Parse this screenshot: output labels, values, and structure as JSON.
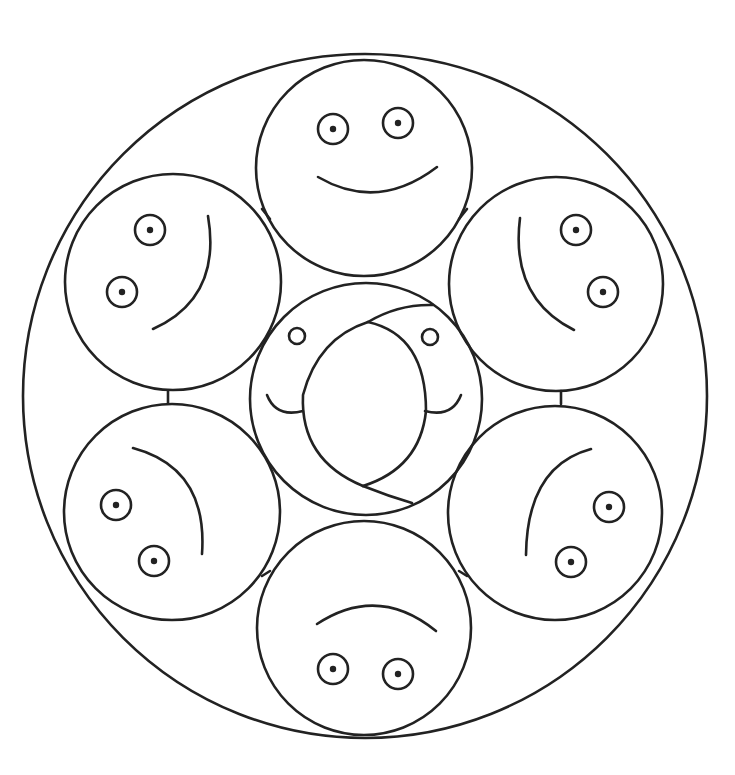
{
  "canvas": {
    "width": 735,
    "height": 775,
    "background": "#ffffff",
    "stroke": "#222222"
  },
  "mandala": {
    "outer_circle": {
      "cx": 365,
      "cy": 396,
      "r": 342
    },
    "center_face": {
      "circle": {
        "cx": 366,
        "cy": 399,
        "r": 116
      },
      "eyes": [
        {
          "cx": 297,
          "cy": 336,
          "r": 8
        },
        {
          "cx": 430,
          "cy": 337,
          "r": 8
        }
      ],
      "smiles": [
        "M 267 395 Q 276 418 303 411",
        "M 461 395 Q 452 418 425 411"
      ],
      "swirl": [
        "M 368 322 Q 318 338 303 395 Q 300 460 363 486",
        "M 368 322 Q 426 335 426 411 Q 420 468 363 486",
        "M 368 322 Q 398 304 433 305",
        "M 363 486 Q 388 496 412 503"
      ]
    },
    "faces": [
      {
        "name": "top",
        "circle": {
          "cx": 364,
          "cy": 168,
          "r": 108
        },
        "eyes": [
          {
            "cx": 333,
            "cy": 129
          },
          {
            "cx": 398,
            "cy": 123
          }
        ],
        "mouth": "M 318 177 Q 378 212 437 167"
      },
      {
        "name": "upper-right",
        "circle": {
          "cx": 556,
          "cy": 284,
          "r": 107
        },
        "eyes": [
          {
            "cx": 576,
            "cy": 230
          },
          {
            "cx": 603,
            "cy": 292
          }
        ],
        "mouth": "M 520 218 Q 510 298 574 330"
      },
      {
        "name": "lower-right",
        "circle": {
          "cx": 555,
          "cy": 513,
          "r": 107
        },
        "eyes": [
          {
            "cx": 609,
            "cy": 507
          },
          {
            "cx": 571,
            "cy": 562
          }
        ],
        "mouth": "M 591 449 Q 527 466 526 555"
      },
      {
        "name": "bottom",
        "circle": {
          "cx": 364,
          "cy": 628,
          "r": 107
        },
        "eyes": [
          {
            "cx": 333,
            "cy": 669
          },
          {
            "cx": 398,
            "cy": 674
          }
        ],
        "mouth": "M 317 624 Q 378 584 436 631"
      },
      {
        "name": "lower-left",
        "circle": {
          "cx": 172,
          "cy": 512,
          "r": 108
        },
        "eyes": [
          {
            "cx": 116,
            "cy": 505
          },
          {
            "cx": 154,
            "cy": 561
          }
        ],
        "mouth": "M 133 448 Q 208 468 202 554"
      },
      {
        "name": "upper-left",
        "circle": {
          "cx": 173,
          "cy": 282,
          "r": 108
        },
        "eyes": [
          {
            "cx": 150,
            "cy": 230
          },
          {
            "cx": 122,
            "cy": 292
          }
        ],
        "mouth": "M 208 216 Q 222 298 153 329"
      }
    ],
    "eye_ring_r": 15,
    "eye_pupil_r": 3.2,
    "connectors": [
      "M 262 209 L 270 219",
      "M 467 209 L 459 219",
      "M 168 391 L 168 403",
      "M 561 391 L 561 404",
      "M 262 576 L 270 571",
      "M 467 576 L 459 571"
    ]
  }
}
